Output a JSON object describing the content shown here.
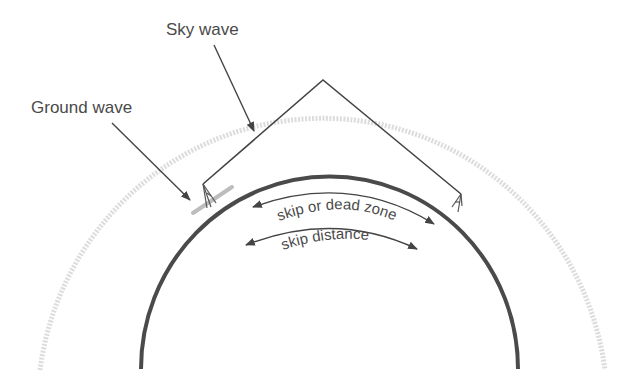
{
  "diagram": {
    "labels": {
      "sky_wave": "Sky wave",
      "ground_wave": "Ground wave",
      "skip_zone": "skip or dead zone",
      "skip_distance": "skip distance"
    },
    "colors": {
      "earth": "#4a4a4a",
      "ionosphere": "#cfcfcf",
      "ray": "#444444",
      "text": "#4a4a4a",
      "ground_wave": "#bdbdbd"
    }
  }
}
